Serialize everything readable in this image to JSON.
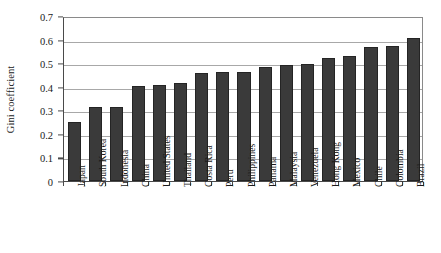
{
  "chart_data": {
    "type": "bar",
    "title": "",
    "subtitle": "",
    "xlabel": "",
    "ylabel": "Gini coefficient",
    "ylim": [
      0,
      0.7
    ],
    "y_ticks": [
      "0",
      "0.1",
      "0.2",
      "0.3",
      "0.4",
      "0.5",
      "0.6",
      "0.7"
    ],
    "y_tick_values": [
      0,
      0.1,
      0.2,
      0.3,
      0.4,
      0.5,
      0.6,
      0.7
    ],
    "grid": "horizontal",
    "legend": "none",
    "bar_color": "#3a3a3a",
    "bar_edge_color": "#242424",
    "axis_color": "#4a4a4a",
    "gridline_color": "#a8a8a8",
    "categories": [
      "Japan",
      "South Korea",
      "Indonesia",
      "China",
      "United States",
      "Thailand",
      "Costa Rica",
      "Peru",
      "Philippines",
      "Panama",
      "Malaysia",
      "Venezuela",
      "Hong Kong",
      "Mexico",
      "Chile",
      "Colombia",
      "Brazil"
    ],
    "values": [
      0.249,
      0.316,
      0.315,
      0.403,
      0.408,
      0.414,
      0.459,
      0.462,
      0.462,
      0.485,
      0.492,
      0.495,
      0.522,
      0.531,
      0.568,
      0.571,
      0.607
    ]
  }
}
